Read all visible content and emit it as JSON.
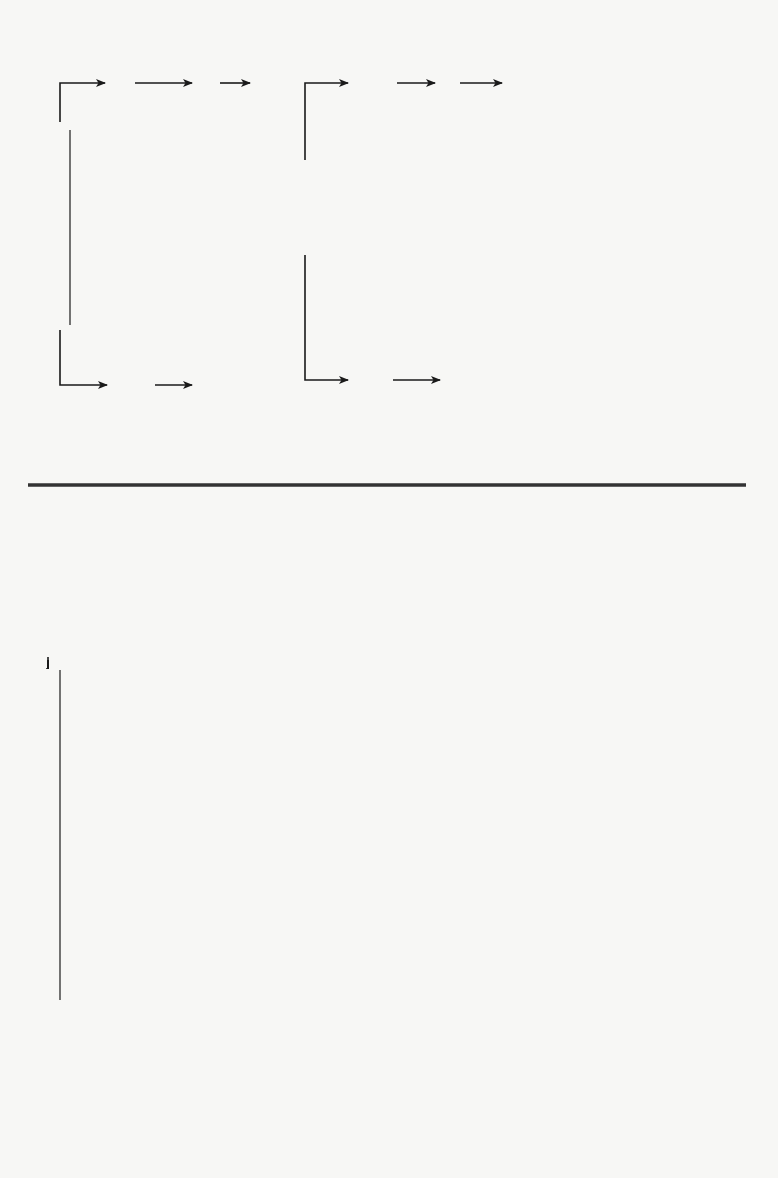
{
  "diagram": {
    "orientation": "rotated-90-ccw",
    "receivables": {
      "invoices": {
        "source": "Customers' (Receivable) Invoices",
        "branches": [
          {
            "steps": [
              "Sales journal",
              "General ledger",
              "Statement"
            ]
          },
          {
            "steps": [
              "Accounts receivable\nsubsidiary ledger",
              "Collections"
            ]
          }
        ]
      },
      "receipts": {
        "source": "Cash Receipts",
        "branches": [
          {
            "steps": [
              "Cash receipts\njournal",
              "General ledger",
              "Statement"
            ]
          },
          {
            "steps": [
              "Accounts receivable\nsubsidiary ledger",
              "Management report"
            ]
          }
        ]
      }
    },
    "payables": {
      "invoices": {
        "source": "Vendors' (Payables) Invoices",
        "branches": [
          {
            "steps": [
              "Purchase\njournal",
              "General\nledger",
              "Statement"
            ]
          },
          {
            "steps": [
              "Payable\nsubsidiary\nledger",
              "Payables"
            ]
          },
          {
            "steps": [
              "Direct operating\nexpense subsidiary\nledger",
              "General ledger",
              "Statement"
            ],
            "dashed": true
          },
          {
            "steps": [
              "Job cost\nsubsidiary\nledger",
              "Management\nreport"
            ],
            "dashed": true
          }
        ]
      },
      "disbursements": {
        "source": "Cash Disbursements",
        "sub_source": "Payables",
        "branches": [
          {
            "steps": [
              "Cash disbursements\njournal",
              "General ledger",
              "Statement"
            ]
          },
          {
            "steps": [
              "Accounts payable\nsubsidiary ledger",
              "Management report"
            ]
          }
        ]
      },
      "payroll": {
        "source": "Cash Disbursement (Payroll)",
        "branches": [
          {
            "steps": [
              "Cash disbursements\njournal",
              "General ledger",
              "Statement"
            ]
          },
          {
            "steps": [
              "Job cost subsidiary\nledger",
              "Management report"
            ]
          }
        ]
      }
    }
  },
  "labels": [
    {
      "id": "cust-inv",
      "text": "Customers' (Receivable) Invoices",
      "x": 62,
      "y": 222
    },
    {
      "id": "sales-journal",
      "text": "Sales journal",
      "x": 120,
      "y": 70
    },
    {
      "id": "gl-1",
      "text": "General ledger",
      "x": 205,
      "y": 70
    },
    {
      "id": "stmt-1",
      "text": "Statement",
      "x": 265,
      "y": 70
    },
    {
      "id": "ar-sub-1",
      "text": "Accounts receivable\nsubsidiary ledger",
      "x": 135,
      "y": 393
    },
    {
      "id": "collections",
      "text": "Collections",
      "x": 205,
      "y": 393
    },
    {
      "id": "cash-receipts",
      "text": "Cash Receipts",
      "x": 305,
      "y": 208
    },
    {
      "id": "cr-journal",
      "text": "Cash receipts\njournal",
      "x": 372,
      "y": 70
    },
    {
      "id": "gl-2",
      "text": "General ledger",
      "x": 448,
      "y": 70
    },
    {
      "id": "stmt-2",
      "text": "Statement",
      "x": 515,
      "y": 70
    },
    {
      "id": "ar-sub-2",
      "text": "Accounts receivable\nsubsidiary ledger",
      "x": 372,
      "y": 393
    },
    {
      "id": "mgmt-1",
      "text": "Management report",
      "x": 452,
      "y": 393
    },
    {
      "id": "vend-inv",
      "text": "Vendors' (Payables) Invoices",
      "x": 48,
      "y": 745
    },
    {
      "id": "purchase-journal",
      "text": "Purchase\njournal",
      "x": 130,
      "y": 672
    },
    {
      "id": "gl-3",
      "text": "General\nledger",
      "x": 222,
      "y": 672
    },
    {
      "id": "stmt-3",
      "text": "Statement",
      "x": 282,
      "y": 672
    },
    {
      "id": "pay-sub",
      "text": "Payable\nsubsidiary\nledger",
      "x": 130,
      "y": 865
    },
    {
      "id": "payables-out",
      "text": "Payables",
      "x": 215,
      "y": 865
    },
    {
      "id": "doe-sub",
      "text": "Direct operating\nexpense subsidiary\nledger",
      "x": 135,
      "y": 925
    },
    {
      "id": "gl-4",
      "text": "General ledger",
      "x": 213,
      "y": 925
    },
    {
      "id": "stmt-4",
      "text": "Statement",
      "x": 275,
      "y": 925
    },
    {
      "id": "jc-sub-1",
      "text": "Job cost\nsubsidiary\nledger",
      "x": 135,
      "y": 1105
    },
    {
      "id": "mgmt-2",
      "text": "Management\nreport",
      "x": 222,
      "y": 1105
    },
    {
      "id": "cash-disb",
      "text": "Cash Disbursements",
      "x": 305,
      "y": 875
    },
    {
      "id": "payables-sub",
      "text": "Payables",
      "x": 338,
      "y": 790
    },
    {
      "id": "cd-journal",
      "text": "Cash disbursements\njournal",
      "x": 387,
      "y": 675
    },
    {
      "id": "gl-5",
      "text": "General ledger",
      "x": 453,
      "y": 675
    },
    {
      "id": "stmt-5",
      "text": "Statement",
      "x": 510,
      "y": 675
    },
    {
      "id": "ap-sub",
      "text": "Accounts payable\nsubsidiary ledger",
      "x": 388,
      "y": 1118
    },
    {
      "id": "mgmt-3",
      "text": "Management report",
      "x": 452,
      "y": 1118
    },
    {
      "id": "cash-disb-payroll",
      "text": "Cash Disbursement (Payroll)",
      "x": 548,
      "y": 812
    },
    {
      "id": "cd-journal-2",
      "text": "Cash disbursements\njournal",
      "x": 605,
      "y": 672
    },
    {
      "id": "gl-6",
      "text": "General ledger",
      "x": 675,
      "y": 672
    },
    {
      "id": "stmt-6",
      "text": "Statement",
      "x": 737,
      "y": 672
    },
    {
      "id": "jc-sub-2",
      "text": "Job cost subsidiary\nledger",
      "x": 608,
      "y": 1118
    },
    {
      "id": "mgmt-4",
      "text": "Management report",
      "x": 682,
      "y": 1118
    }
  ],
  "colors": {
    "ink": "#1a1a1a",
    "paper": "#f7f7f5"
  }
}
